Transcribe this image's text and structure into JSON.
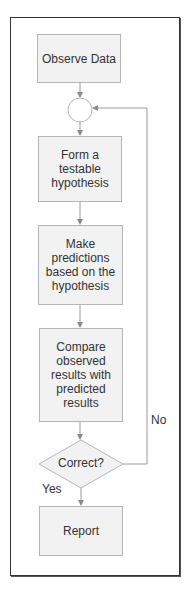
{
  "flowchart": {
    "nodes": [
      {
        "id": "observe",
        "label": "Observe Data",
        "shape": "rect"
      },
      {
        "id": "merge",
        "label": "",
        "shape": "circle"
      },
      {
        "id": "hypothesis",
        "label": "Form a testable hypothesis",
        "shape": "rect"
      },
      {
        "id": "predict",
        "label": "Make predictions based on the hypothesis",
        "shape": "rect"
      },
      {
        "id": "compare",
        "label": "Compare observed results with predicted results",
        "shape": "rect"
      },
      {
        "id": "decision",
        "label": "Correct?",
        "shape": "diamond"
      },
      {
        "id": "report",
        "label": "Report",
        "shape": "rect"
      }
    ],
    "edges": [
      {
        "from": "observe",
        "to": "merge",
        "label": ""
      },
      {
        "from": "merge",
        "to": "hypothesis",
        "label": ""
      },
      {
        "from": "hypothesis",
        "to": "predict",
        "label": ""
      },
      {
        "from": "predict",
        "to": "compare",
        "label": ""
      },
      {
        "from": "compare",
        "to": "decision",
        "label": ""
      },
      {
        "from": "decision",
        "to": "report",
        "label": "Yes"
      },
      {
        "from": "decision",
        "to": "merge",
        "label": "No"
      }
    ],
    "labels": {
      "yes": "Yes",
      "no": "No"
    },
    "colors": {
      "box_fill": "#f2f2f2",
      "box_border": "#b5b5b5",
      "line": "#9a9a9a",
      "frame": "#333333"
    }
  }
}
